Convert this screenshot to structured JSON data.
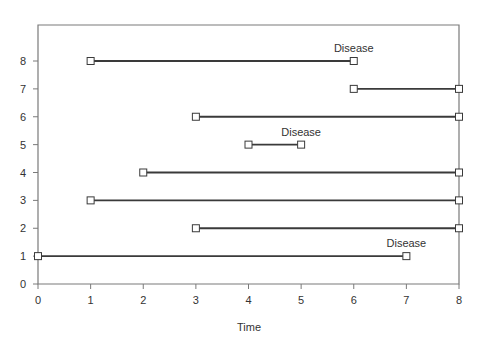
{
  "chart_data": {
    "type": "line",
    "title": "",
    "xlabel": "Time",
    "ylabel": "",
    "xlim": [
      0,
      8
    ],
    "ylim": [
      0,
      8
    ],
    "xticks": [
      0,
      1,
      2,
      3,
      4,
      5,
      6,
      7,
      8
    ],
    "yticks": [
      0,
      1,
      2,
      3,
      4,
      5,
      6,
      7,
      8
    ],
    "grid": false,
    "legend": null,
    "series": [
      {
        "name": "Subject 1",
        "y": 1,
        "start": 0,
        "end": 7,
        "event": "Disease"
      },
      {
        "name": "Subject 2",
        "y": 2,
        "start": 3,
        "end": 8,
        "event": null
      },
      {
        "name": "Subject 3",
        "y": 3,
        "start": 1,
        "end": 8,
        "event": null
      },
      {
        "name": "Subject 4",
        "y": 4,
        "start": 2,
        "end": 8,
        "event": null
      },
      {
        "name": "Subject 5",
        "y": 5,
        "start": 4,
        "end": 5,
        "event": "Disease"
      },
      {
        "name": "Subject 6",
        "y": 6,
        "start": 3,
        "end": 8,
        "event": null
      },
      {
        "name": "Subject 7",
        "y": 7,
        "start": 6,
        "end": 8,
        "event": null
      },
      {
        "name": "Subject 8",
        "y": 8,
        "start": 1,
        "end": 6,
        "event": "Disease"
      }
    ],
    "annotations": [
      {
        "text": "Disease",
        "x": 6,
        "y": 8
      },
      {
        "text": "Disease",
        "x": 5,
        "y": 5
      },
      {
        "text": "Disease",
        "x": 7,
        "y": 1
      }
    ]
  },
  "axis": {
    "x_label": "Time",
    "x_ticks": [
      "0",
      "1",
      "2",
      "3",
      "4",
      "5",
      "6",
      "7",
      "8"
    ],
    "y_ticks": [
      "0",
      "1",
      "2",
      "3",
      "4",
      "5",
      "6",
      "7",
      "8"
    ]
  },
  "colors": {
    "line": "#3a3a3a",
    "frame": "#7a7a7a",
    "marker_fill": "#ffffff",
    "text": "#333333"
  }
}
